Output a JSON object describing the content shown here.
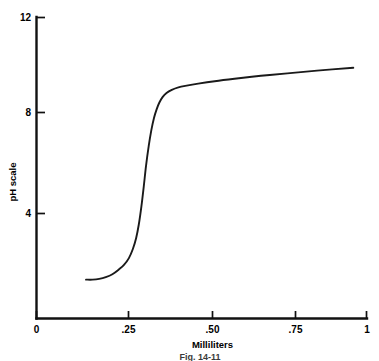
{
  "figure": {
    "caption": "Fig. 14-11",
    "background_color": "#ffffff",
    "line_color": "#1a1a1a"
  },
  "chart_data": {
    "type": "line",
    "title": "",
    "subtitle": "",
    "xlabel": "Milliliters",
    "ylabel": "pH scale",
    "xlim": [
      0,
      1
    ],
    "ylim": [
      0,
      12
    ],
    "grid": false,
    "legend": null,
    "legend_position": "none",
    "x_ticks": [
      0,
      0.25,
      0.5,
      0.75,
      1
    ],
    "x_tick_labels": [
      "0",
      ".25",
      ".50",
      ".75",
      "1"
    ],
    "y_ticks": [
      4,
      8,
      12
    ],
    "y_tick_labels": [
      "4",
      "8",
      "12"
    ],
    "annotations": [],
    "series": [
      {
        "name": "Titration curve",
        "color": "#1a1a1a",
        "x": [
          0.15,
          0.17,
          0.19,
          0.21,
          0.23,
          0.25,
          0.265,
          0.28,
          0.292,
          0.302,
          0.31,
          0.318,
          0.325,
          0.332,
          0.34,
          0.348,
          0.356,
          0.364,
          0.372,
          0.382,
          0.394,
          0.41,
          0.43,
          0.455,
          0.49,
          0.54,
          0.6,
          0.68,
          0.76,
          0.85,
          0.96
        ],
        "y": [
          1.3,
          1.3,
          1.33,
          1.4,
          1.52,
          1.72,
          1.9,
          2.18,
          2.55,
          3.0,
          3.55,
          4.3,
          5.1,
          5.95,
          6.75,
          7.4,
          7.9,
          8.25,
          8.52,
          8.75,
          8.92,
          9.05,
          9.15,
          9.22,
          9.3,
          9.4,
          9.5,
          9.62,
          9.72,
          9.83,
          9.95
        ]
      }
    ]
  },
  "axes": {
    "x_axis_name": "x-axis",
    "y_axis_name": "y-axis"
  }
}
